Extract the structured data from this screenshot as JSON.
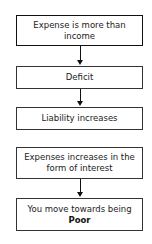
{
  "flowchart": {
    "steps": [
      {
        "text": "Expense is more than income"
      },
      {
        "text": "Deficit"
      },
      {
        "text": "Liability increases"
      },
      {
        "text": "Expenses increases in the form of interest"
      },
      {
        "text_prefix": "You move towards being",
        "text_emphasis": "Poor"
      }
    ],
    "arrows": [
      {
        "from": 0,
        "to": 1
      },
      {
        "from": 1,
        "to": 2
      },
      {
        "from": 3,
        "to": 4
      }
    ]
  }
}
